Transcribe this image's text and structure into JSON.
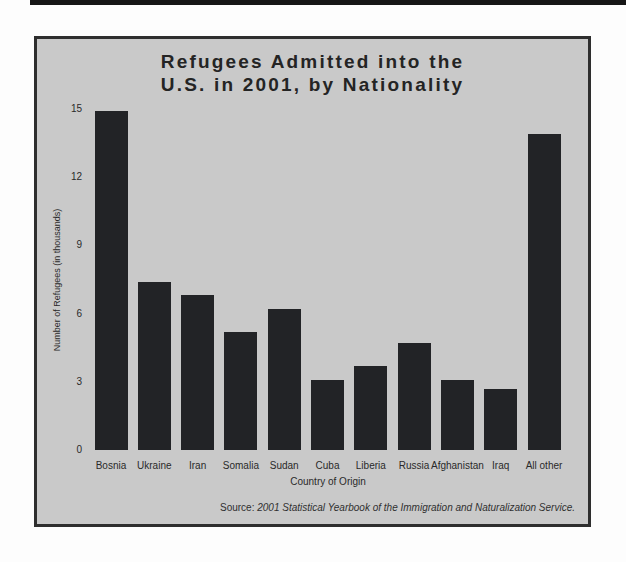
{
  "page": {
    "top_rule_color": "#161616",
    "panel_bg": "#c9c9c9",
    "panel_border": "#2e2e2e"
  },
  "chart_data": {
    "type": "bar",
    "title_lines": [
      "Refugees Admitted into the",
      "U.S. in 2001, by Nationality"
    ],
    "categories": [
      "Bosnia",
      "Ukraine",
      "Iran",
      "Somalia",
      "Sudan",
      "Cuba",
      "Liberia",
      "Russia",
      "Afghanistan",
      "Iraq",
      "All other"
    ],
    "values": [
      14.9,
      7.4,
      6.8,
      5.2,
      6.2,
      3.1,
      3.7,
      4.7,
      3.1,
      2.7,
      13.9
    ],
    "xlabel": "Country of Origin",
    "ylabel": "Number of Refugees (in thousands)",
    "y_ticks": [
      0,
      3,
      6,
      9,
      12,
      15
    ],
    "ylim": [
      0,
      15
    ],
    "bar_color": "#222326",
    "grid": false,
    "legend": false
  },
  "source_note": {
    "prefix": "Source: ",
    "text": "2001 Statistical Yearbook of the Immigration and Naturalization Service."
  }
}
